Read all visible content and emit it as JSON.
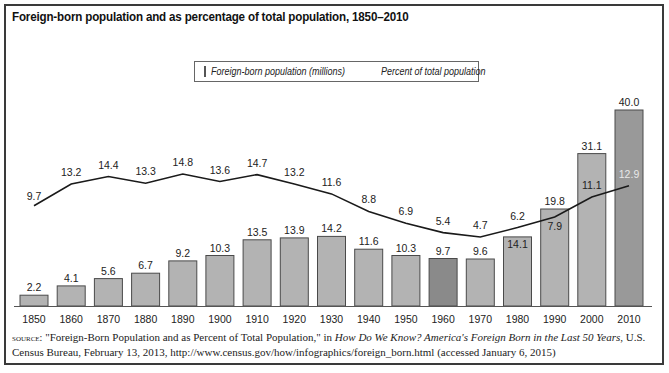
{
  "title": "Foreign-born population and as percentage of total population, 1850–2010",
  "legend": {
    "bar_label": "Foreign-born population (millions)",
    "line_label": "Percent of total population"
  },
  "colors": {
    "bar": "#b3b3b3",
    "bar_dark": "#8a8a8a",
    "bar_2010": "#999999",
    "bar_border": "#4a4a4a",
    "line": "#1a1a1a"
  },
  "source": {
    "prefix": "source:",
    "text_1": " \"Foreign-Born Population and as Percent of Total Population,\" in ",
    "italic": "How Do We Know? America's Foreign Born in the Last 50 Years",
    "text_2": ", U.S. Census Bureau, February 13, 2013, http://www.census.gov/how/infographics/foreign_born.html (accessed January 6, 2015)"
  },
  "chart_data": {
    "type": "bar",
    "title": "Foreign-born population and as percentage of total population, 1850–2010",
    "xlabel": "",
    "ylabel": "",
    "categories": [
      "1850",
      "1860",
      "1870",
      "1880",
      "1890",
      "1900",
      "1910",
      "1920",
      "1930",
      "1940",
      "1950",
      "1960",
      "1970",
      "1980",
      "1990",
      "2000",
      "2010"
    ],
    "series": [
      {
        "name": "Foreign-born population (millions)",
        "type": "bar",
        "values": [
          2.2,
          4.1,
          5.6,
          6.7,
          9.2,
          10.3,
          13.5,
          13.9,
          14.2,
          11.6,
          10.3,
          9.7,
          9.6,
          14.1,
          19.8,
          31.1,
          40.0
        ]
      },
      {
        "name": "Percent of total population",
        "type": "line",
        "values": [
          9.7,
          13.2,
          14.4,
          13.3,
          14.8,
          13.6,
          14.7,
          13.2,
          11.6,
          8.8,
          6.9,
          5.4,
          4.7,
          6.2,
          7.9,
          11.1,
          12.9
        ]
      }
    ],
    "highlighted_bars": [
      "1960",
      "2010"
    ],
    "grid": false,
    "legend_position": "top-center",
    "axes_visible": false
  }
}
